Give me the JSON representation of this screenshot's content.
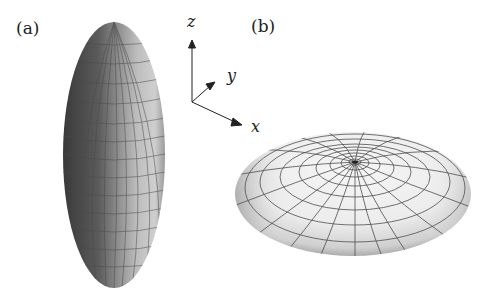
{
  "panels": {
    "a": {
      "label": "(a)",
      "shape": "prolate ellipsoid"
    },
    "b": {
      "label": "(b)",
      "shape": "oblate ellipsoid"
    }
  },
  "axes": {
    "z": "z",
    "y": "y",
    "x": "x"
  },
  "colors": {
    "background": "#ffffff",
    "grid_line": "#555555",
    "prolate_dark": "#3a3a3a",
    "prolate_light": "#c8c8c8",
    "oblate_light": "#f2f2f2",
    "oblate_shadow": "#9a9a9a"
  }
}
